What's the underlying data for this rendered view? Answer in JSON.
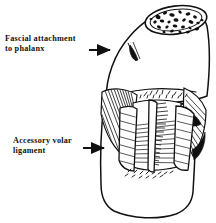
{
  "figure": {
    "domain": "anatomical-line-drawing",
    "background_color": "#ffffff",
    "ink_color": "#111111",
    "width": 216,
    "height": 223
  },
  "labels": [
    {
      "id": "fascial-attachment",
      "line1": "Fascial attachment",
      "line2": "to phalanx",
      "arrow": "right-arrow-icon",
      "x": 5,
      "y": 34
    },
    {
      "id": "accessory-volar-ligament",
      "line1": "Accessory volar",
      "line2": "ligament",
      "arrow": "right-arrow-icon",
      "x": 13,
      "y": 136
    }
  ],
  "annotations": {
    "arrow_fascial_label": "arrow pointing to phalanx shaft",
    "arrow_accessory_label": "arrow pointing to accessory volar ligament",
    "bone_cross_section_label": "cancellous bone cross section",
    "top_cap_label": "cut end of proximal phalanx"
  }
}
